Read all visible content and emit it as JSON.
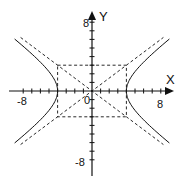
{
  "chart_data": {
    "type": "line",
    "title": "",
    "xlabel": "X",
    "ylabel": "Y",
    "xlim": [
      -8,
      8
    ],
    "ylim": [
      -8,
      8
    ],
    "grid": false,
    "tick_labels": {
      "x": [
        "-8",
        "0",
        "8"
      ],
      "y": [
        "8",
        "-8"
      ]
    },
    "series": [
      {
        "name": "hyperbola x^2/16 - y^2/9 = 1",
        "style": "solid",
        "a": 4,
        "b": 3
      },
      {
        "name": "asymptote y = 3x/4",
        "style": "dashed",
        "slope": 0.75
      },
      {
        "name": "asymptote y = -3x/4",
        "style": "dashed",
        "slope": -0.75
      },
      {
        "name": "fundamental rectangle",
        "style": "dashed",
        "x": [
          -4,
          4
        ],
        "y": [
          -3,
          3
        ]
      }
    ],
    "vertices": [
      [
        -4,
        0
      ],
      [
        4,
        0
      ]
    ]
  },
  "labels": {
    "x_axis": "X",
    "y_axis": "Y",
    "x_min": "-8",
    "x_max": "8",
    "y_max": "8",
    "y_min": "-8",
    "origin": "0"
  }
}
